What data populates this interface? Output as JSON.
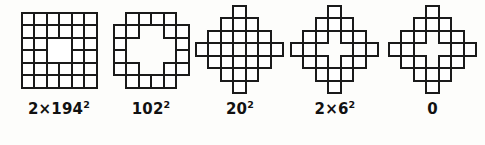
{
  "figure": {
    "title": "",
    "background_color": "#fdfdfb",
    "stroke_color": "#1a1a1a",
    "fill_color": "#ffffff",
    "panel_count": 5
  },
  "panels": [
    {
      "id": "panel-1",
      "shape_name": "six-by-six-grid-with-central-square-hole",
      "label_text": "2×194²",
      "label_base": "2×194",
      "label_exponent": "2",
      "cell_size": 12.5,
      "cells": [
        [
          0,
          0
        ],
        [
          1,
          0
        ],
        [
          2,
          0
        ],
        [
          3,
          0
        ],
        [
          4,
          0
        ],
        [
          5,
          0
        ],
        [
          0,
          1
        ],
        [
          1,
          1
        ],
        [
          2,
          1
        ],
        [
          3,
          1
        ],
        [
          4,
          1
        ],
        [
          5,
          1
        ],
        [
          0,
          2
        ],
        [
          1,
          2
        ],
        [
          4,
          2
        ],
        [
          5,
          2
        ],
        [
          0,
          3
        ],
        [
          1,
          3
        ],
        [
          4,
          3
        ],
        [
          5,
          3
        ],
        [
          0,
          4
        ],
        [
          1,
          4
        ],
        [
          2,
          4
        ],
        [
          3,
          4
        ],
        [
          4,
          4
        ],
        [
          5,
          4
        ],
        [
          0,
          5
        ],
        [
          1,
          5
        ],
        [
          2,
          5
        ],
        [
          3,
          5
        ],
        [
          4,
          5
        ],
        [
          5,
          5
        ]
      ],
      "hole": {
        "x": 2,
        "y": 2,
        "w": 2,
        "h": 2
      },
      "grid_cols": 6,
      "grid_rows": 6
    },
    {
      "id": "panel-2",
      "shape_name": "octagonal-ring-frame",
      "label_text": "102²",
      "label_base": "102",
      "label_exponent": "2",
      "cell_size": 12.5,
      "cells": [
        [
          1,
          0
        ],
        [
          2,
          0
        ],
        [
          3,
          0
        ],
        [
          4,
          0
        ],
        [
          0,
          1
        ],
        [
          1,
          1
        ],
        [
          4,
          1
        ],
        [
          5,
          1
        ],
        [
          0,
          2
        ],
        [
          5,
          2
        ],
        [
          0,
          3
        ],
        [
          5,
          3
        ],
        [
          0,
          4
        ],
        [
          1,
          4
        ],
        [
          4,
          4
        ],
        [
          5,
          4
        ],
        [
          1,
          5
        ],
        [
          2,
          5
        ],
        [
          3,
          5
        ],
        [
          4,
          5
        ]
      ],
      "grid_cols": 6,
      "grid_rows": 6
    },
    {
      "id": "panel-3",
      "shape_name": "diamond-with-cross-hole",
      "label_text": "20²",
      "label_base": "20",
      "label_exponent": "2",
      "cell_size": 12.5,
      "cells": [
        [
          3,
          0
        ],
        [
          2,
          1
        ],
        [
          3,
          1
        ],
        [
          4,
          1
        ],
        [
          1,
          2
        ],
        [
          2,
          2
        ],
        [
          3,
          2
        ],
        [
          4,
          2
        ],
        [
          5,
          2
        ],
        [
          0,
          3
        ],
        [
          1,
          3
        ],
        [
          2,
          3
        ],
        [
          4,
          3
        ],
        [
          5,
          3
        ],
        [
          6,
          3
        ],
        [
          1,
          4
        ],
        [
          2,
          4
        ],
        [
          3,
          4
        ],
        [
          4,
          4
        ],
        [
          5,
          4
        ],
        [
          2,
          5
        ],
        [
          3,
          5
        ],
        [
          4,
          5
        ],
        [
          3,
          6
        ]
      ],
      "grid_cols": 7,
      "grid_rows": 7
    },
    {
      "id": "panel-4",
      "shape_name": "diamond-with-square-hole-and-arms",
      "label_text": "2×6²",
      "label_base": "2×6",
      "label_exponent": "2",
      "cell_size": 12.5,
      "cells": [
        [
          3,
          0
        ],
        [
          2,
          1
        ],
        [
          3,
          1
        ],
        [
          4,
          1
        ],
        [
          1,
          2
        ],
        [
          2,
          2
        ],
        [
          4,
          2
        ],
        [
          5,
          2
        ],
        [
          0,
          3
        ],
        [
          1,
          3
        ],
        [
          5,
          3
        ],
        [
          6,
          3
        ],
        [
          1,
          4
        ],
        [
          2,
          4
        ],
        [
          4,
          4
        ],
        [
          5,
          4
        ],
        [
          2,
          5
        ],
        [
          3,
          5
        ],
        [
          4,
          5
        ],
        [
          3,
          6
        ]
      ],
      "grid_cols": 7,
      "grid_rows": 7
    },
    {
      "id": "panel-5",
      "shape_name": "diamond-ring-hollow",
      "label_text": "0",
      "label_base": "0",
      "label_exponent": "",
      "cell_size": 12.5,
      "cells": [
        [
          3,
          0
        ],
        [
          2,
          1
        ],
        [
          3,
          1
        ],
        [
          4,
          1
        ],
        [
          1,
          2
        ],
        [
          2,
          2
        ],
        [
          4,
          2
        ],
        [
          5,
          2
        ],
        [
          0,
          3
        ],
        [
          1,
          3
        ],
        [
          5,
          3
        ],
        [
          6,
          3
        ],
        [
          1,
          4
        ],
        [
          2,
          4
        ],
        [
          4,
          4
        ],
        [
          5,
          4
        ],
        [
          2,
          5
        ],
        [
          3,
          5
        ],
        [
          4,
          5
        ],
        [
          3,
          6
        ]
      ],
      "grid_cols": 7,
      "grid_rows": 7
    }
  ]
}
